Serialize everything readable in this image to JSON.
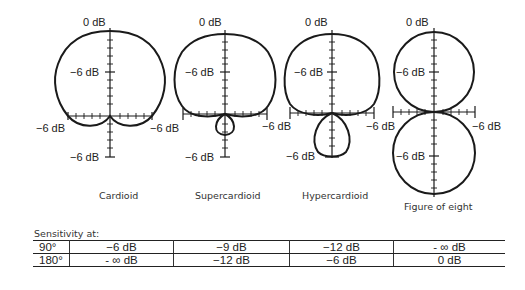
{
  "diagrams": [
    {
      "name": "Cardioid",
      "top_label": "0 dB",
      "mid_label": "−6 dB",
      "left_label": "−6 dB",
      "right_label": "−6 dB",
      "bottom_label": "−6 dB"
    },
    {
      "name": "Supercardioid",
      "top_label": "0 dB",
      "mid_label": "−6 dB",
      "left_label": "−6 dB",
      "right_label": "−6 dB",
      "bottom_label": "−6 dB"
    },
    {
      "name": "Hypercardioid",
      "top_label": "0 dB",
      "mid_label": "−6 dB",
      "left_label": "−6 dB",
      "right_label": "−6 dB",
      "bottom_label": "−6 dB"
    },
    {
      "name": "Figure of eight",
      "top_label": "0 dB",
      "mid_label": "−6 dB",
      "left_label": "−6 dB",
      "right_label": "−6 dB",
      "bottom_label": "−6 dB"
    }
  ],
  "sensitivity": {
    "title": "Sensitivity at:",
    "rows": [
      {
        "angle": "90°",
        "values": [
          "−6 dB",
          "−9 dB",
          "−12 dB",
          "- ∞ dB"
        ]
      },
      {
        "angle": "180°",
        "values": [
          "- ∞ dB",
          "−12 dB",
          "−6 dB",
          "0 dB"
        ]
      }
    ]
  }
}
